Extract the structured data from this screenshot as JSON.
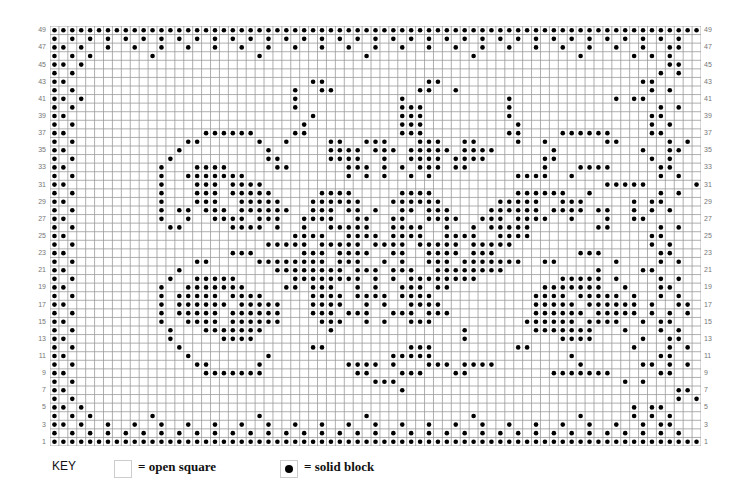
{
  "chart_data": {
    "type": "table",
    "rows": 49,
    "cols": 73,
    "row_labels_odd": [
      49,
      47,
      45,
      43,
      41,
      39,
      37,
      35,
      33,
      31,
      29,
      27,
      25,
      23,
      21,
      19,
      17,
      15,
      13,
      11,
      9,
      7,
      5,
      3,
      1
    ],
    "grid_encoding": "# = solid block, . = open square; first string is row 49 (top), last is row 1 (bottom)",
    "grid": [
      "#########################################################################",
      "#.#.#.#.#.#.#.#.#.#.#.#.#.#.#.#.#.#.#.#.#.#.#.#.#.#.#.#.#.#.#.#.#.#.#.#",
      "##.#..#..#..#..#..#..#..#..#..#..#..#..#..#..#..#..#..#..#..#..#..#..##",
      "#.#.#......#...........#...........#...........#...........#.....#.#.#",
      "##.#.................................................................##",
      "#.#.................................................................#.#",
      "##...........................##...........##......................##",
      "#.#........................#..##.........##..#.....................#.#",
      "##.#.......................#...........#...........#...........#.##",
      "#.#........................#...........###.........#................#.#",
      "##...........................#.........###.........#...............##",
      "#.#.........................#..........###..........#..............#.#",
      "##...............######....##..........###.........##....######....##",
      "#.#............##......#..#....##..###...###..##....#..#......##.....#.#",
      "##............#.........#......####.###.#####.####......#.........#..##",
      "#.#..........#..........##.....####..#..####.####......##..........#.#",
      "##..........#...####.....##......###.#.#.###.##........#...####.....##",
      "#.#.........#..#######...........#.#.#..#.#.........####..#.........#.#",
      "##..........#...###.####......................................#####.....##",
      "#.#.........#...###.#####.....####.....####.........######..#.......#.#",
      "##..........#...###..#####...######...######......#####..###.....#.##",
      "#.#.........#.##.###.######..###.##.#..##.###....######.####.##..#.#.#",
      "##..........#..#..####.###..####..##..##..####..###.####..#...#..##",
      "#.#..........##.....####.#..#..#####..####..#..#.#####.......##.....#.#",
      "##.........................####..####.####..####..####.............##",
      "#.#.....................#####.#####.####.#####.#####...............#.#",
      "##..................###.....###.####..##..####.###.........###......##",
      "#.#.............##.....########.###..#.#..###.#######..##......#....#.#",
      "##............#..........########.###.###..########..........#....##",
      "#.#..........#..#####......########.#.#.########.........#####.#....#.#",
      "##..........#..#######....##.###..#.#..###.##..........#######..#...##",
      "#.#.........#.#####.####.....####.####.####...........####.#####.#..#.#",
      "##..........#.######.#####...####..#.#..####..........#####.######.#..##",
      "#.#.........#.#####.######...###.###..###.###.........######.#####.#.#.#",
      "##..........#..####.######....###..#.#..###..........######.####..#.##",
      "#.#..........#...#######.......#..............#.......#######...#...#.#",
      "##...........#.....####.......................#..........####.....#..##",
      "#.#...........#..............##.........###.........##...........#...#.#",
      "##.............#........#.............#####...............#.........##",
      "#.#.............##.....#.........####.#...###.####.........#......##.#.#",
      "##...............#######..........##...###...##.........#######.....##",
      "#.#.................................###.........................#.#",
      "##.....................................#..............................##",
      "#.#...................................................................#.#",
      "##.#.............................................................#.##",
      "#.#.#......#...........#...........#...........#...........#.....#.#.#",
      "##.#..#..#..#..#..#..#..#..#..#..#..#..#..#..#..#..#..#..#..#..#..#.##",
      "#.#.#.#.#.#.#.#.#.#.#.#.#.#.#.#.#.#.#.#.#.#.#.#.#.#.#.#.#.#.#.#.#.#.#.#",
      "#########################################################################"
    ],
    "grid_lines": true,
    "legend": [
      {
        "symbol": "open",
        "label": "= open square"
      },
      {
        "symbol": "solid",
        "label": "= solid block"
      }
    ]
  },
  "key": {
    "title": "KEY",
    "open_label": "= open square",
    "solid_label": "= solid block"
  },
  "colors": {
    "grid_line": "#9a9a9a",
    "dot": "#000000",
    "label": "#777777"
  }
}
